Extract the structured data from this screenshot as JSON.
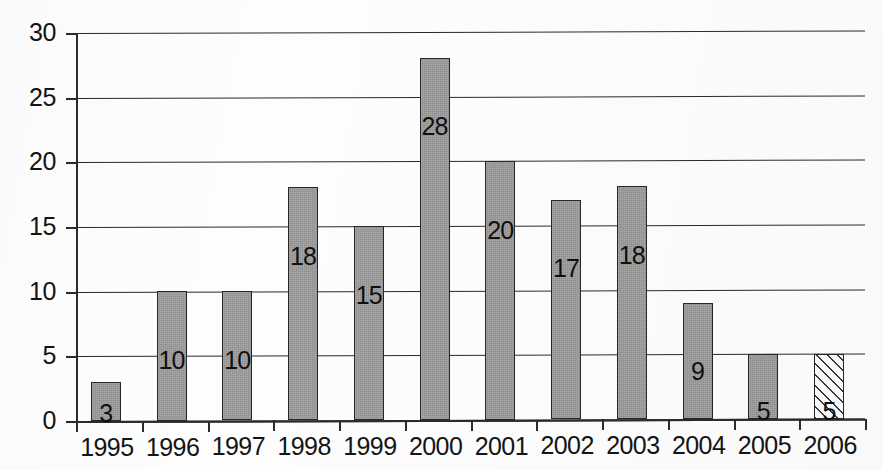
{
  "chart_data": {
    "type": "bar",
    "title": "",
    "subtitle": "",
    "xlabel": "",
    "ylabel": "",
    "categories": [
      "1995",
      "1996",
      "1997",
      "1998",
      "1999",
      "2000",
      "2001",
      "2002",
      "2003",
      "2004",
      "2005",
      "2006"
    ],
    "values": [
      3,
      10,
      10,
      18,
      15,
      28,
      20,
      17,
      18,
      9,
      5,
      5
    ],
    "data_labels": [
      "3",
      "10",
      "10",
      "18",
      "15",
      "28",
      "20",
      "17",
      "18",
      "9",
      "5",
      "5"
    ],
    "bar_styles": [
      "solid",
      "solid",
      "solid",
      "solid",
      "solid",
      "solid",
      "solid",
      "solid",
      "solid",
      "solid",
      "solid",
      "hatched"
    ],
    "ylim": [
      0,
      30
    ],
    "y_ticks": [
      0,
      5,
      10,
      15,
      20,
      25,
      30
    ],
    "y_tick_labels": [
      "0",
      "5",
      "10",
      "15",
      "20",
      "25",
      "30"
    ],
    "grid": true,
    "grid_orientation": "horizontal",
    "legend": false,
    "legend_position": "none",
    "colors": {
      "bar_fill": "#9c9c9c",
      "bar_border": "#272727",
      "hatch_fill": "#fbfbfb",
      "hatch_line": "#3a3a3a",
      "axis": "#2b2b2b",
      "gridline": "#2b2b2b",
      "text": "#141414",
      "background": "#fdfdfd"
    }
  },
  "axes": {
    "y_tick_labels": [
      "30",
      "25",
      "20",
      "15",
      "10",
      "5",
      "0"
    ],
    "x_tick_labels": [
      "1995",
      "1996",
      "1997",
      "1998",
      "1999",
      "2000",
      "2001",
      "2002",
      "2003",
      "2004",
      "2005",
      "2006"
    ]
  }
}
